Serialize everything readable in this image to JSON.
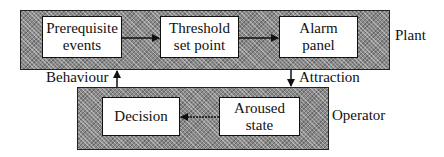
{
  "groups": {
    "plant": {
      "label": "Plant"
    },
    "operator": {
      "label": "Operator"
    }
  },
  "nodes": {
    "prerequisite": "Prerequisite\nevents",
    "threshold": "Threshold\nset point",
    "alarm": "Alarm\npanel",
    "decision": "Decision",
    "aroused": "Aroused\nstate"
  },
  "edges": {
    "behaviour": "Behaviour",
    "attraction": "Attraction"
  },
  "flows": [
    {
      "from": "Prerequisite events",
      "to": "Threshold set point"
    },
    {
      "from": "Threshold set point",
      "to": "Alarm panel"
    },
    {
      "from": "Alarm panel",
      "to": "Operator",
      "label": "Attraction"
    },
    {
      "from": "Aroused state",
      "to": "Decision"
    },
    {
      "from": "Operator",
      "to": "Plant",
      "label": "Behaviour"
    }
  ]
}
